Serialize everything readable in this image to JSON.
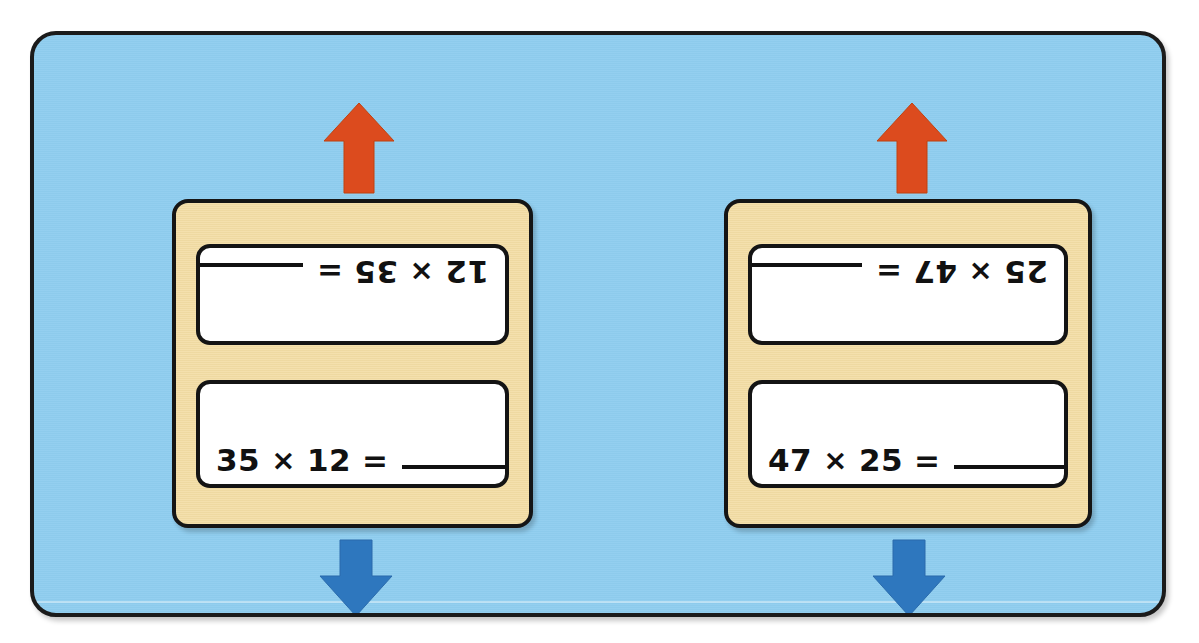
{
  "worksheet": {
    "panel": {
      "background_color": "#8FCDEF",
      "border_color": "#1b1b1b"
    },
    "card_color": "#F3DDA4",
    "arrow_up_color": "#DC4B1E",
    "arrow_down_color": "#2E77BE",
    "blank_placeholder": "",
    "cards": [
      {
        "id": "card-left",
        "arrow_up": "arrow-up-icon",
        "arrow_down": "arrow-down-icon",
        "top_box": {
          "orientation": "rotated-180",
          "factor_a": "12",
          "operator": "×",
          "factor_b": "35",
          "equals": "=",
          "answer": "",
          "full_text": "12 × 35 = ______"
        },
        "bottom_box": {
          "orientation": "upright",
          "factor_a": "35",
          "operator": "×",
          "factor_b": "12",
          "equals": "=",
          "answer": "",
          "full_text": "35 × 12 = ______"
        }
      },
      {
        "id": "card-right",
        "arrow_up": "arrow-up-icon",
        "arrow_down": "arrow-down-icon",
        "top_box": {
          "orientation": "rotated-180",
          "factor_a": "25",
          "operator": "×",
          "factor_b": "47",
          "equals": "=",
          "answer": "",
          "full_text": "25 × 47 = ______"
        },
        "bottom_box": {
          "orientation": "upright",
          "factor_a": "47",
          "operator": "×",
          "factor_b": "25",
          "equals": "=",
          "answer": "",
          "full_text": "47 × 25 = ______"
        }
      }
    ]
  }
}
